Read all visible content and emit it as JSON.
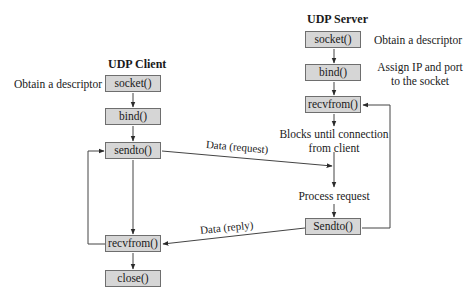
{
  "diagram": {
    "type": "flowchart",
    "client": {
      "title": "UDP Client",
      "steps": [
        "socket()",
        "bind()",
        "sendto()",
        "recvfrom()",
        "close()"
      ],
      "annotations": {
        "socket": "Obtain a descriptor"
      }
    },
    "server": {
      "title": "UDP Server",
      "steps": [
        "socket()",
        "bind()",
        "recvfrom()",
        "Sendto()"
      ],
      "annotations": {
        "socket": "Obtain a descriptor",
        "bind_line1": "Assign IP and port",
        "bind_line2": "to the socket",
        "blocks_line1": "Blocks until connection",
        "blocks_line2": "from client",
        "process": "Process request"
      }
    },
    "messages": {
      "request": "Data (request)",
      "reply": "Data (reply)"
    },
    "edges": [
      {
        "from": "client.socket()",
        "to": "client.bind()"
      },
      {
        "from": "client.bind()",
        "to": "client.sendto()"
      },
      {
        "from": "client.sendto()",
        "to": "client.recvfrom()"
      },
      {
        "from": "client.recvfrom()",
        "to": "client.close()"
      },
      {
        "from": "client.recvfrom()",
        "to": "client.sendto()",
        "kind": "loop"
      },
      {
        "from": "client.sendto()",
        "to": "server.process",
        "label": "Data (request)"
      },
      {
        "from": "server.socket()",
        "to": "server.bind()"
      },
      {
        "from": "server.bind()",
        "to": "server.recvfrom()"
      },
      {
        "from": "server.recvfrom()",
        "to": "server.process"
      },
      {
        "from": "server.process",
        "to": "server.Sendto()"
      },
      {
        "from": "server.Sendto()",
        "to": "server.recvfrom()",
        "kind": "loop"
      },
      {
        "from": "server.Sendto()",
        "to": "client.recvfrom()",
        "label": "Data (reply)"
      }
    ],
    "colors": {
      "box_fill": "#d6d6d6",
      "box_border": "#6e6e6e",
      "line": "#444444",
      "text": "#1a1a1a"
    }
  }
}
